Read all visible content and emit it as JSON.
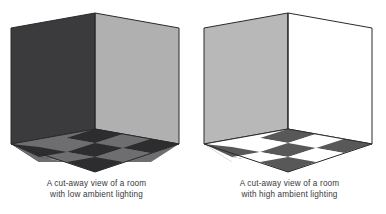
{
  "figure": {
    "title": "A cut-away view of a room",
    "panels": [
      {
        "id": "low-ambient",
        "caption_line_1": "A cut-away view of a room",
        "caption_line_2": "with low ambient lighting",
        "lighting": "low ambient lighting",
        "colors": {
          "left_wall": "#3b3b3d",
          "right_wall": "#b0b0b0",
          "floor_dark_tile": "#2d2d2f",
          "floor_light_tile": "#6e6e70",
          "outline": "#2a2a2c",
          "background": "#ffffff"
        }
      },
      {
        "id": "high-ambient",
        "caption_line_1": "A cut-away view of a room",
        "caption_line_2": "with high ambient lighting",
        "lighting": "high ambient lighting",
        "colors": {
          "left_wall": "#b8b8b8",
          "right_wall": "#ffffff",
          "floor_dark_tile": "#585859",
          "floor_light_tile": "#ffffff",
          "outline": "#2a2a2c",
          "background": "#ffffff"
        }
      }
    ],
    "geometry": {
      "floor_grid_rows": 3,
      "floor_grid_cols": 3,
      "projection": "isometric",
      "wall_count": 2
    }
  }
}
